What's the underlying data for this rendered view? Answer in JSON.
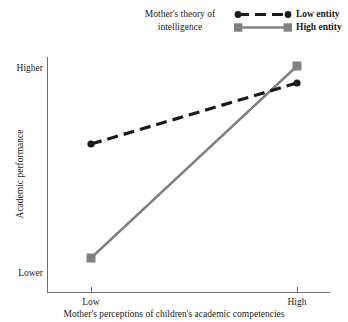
{
  "chart_data": {
    "type": "line",
    "title": "",
    "xlabel": "Mother's perceptions of children's academic competencies",
    "ylabel": "Academic performance",
    "categories": [
      "Low",
      "High"
    ],
    "x": [
      91,
      297
    ],
    "ytick_labels": [
      "Higher",
      "Lower"
    ],
    "ylim": [
      0,
      1
    ],
    "grid": false,
    "legend_position": "top-right",
    "legend_title": "Mother's theory of intelligence",
    "series": [
      {
        "name": "Low entity",
        "values": [
          0.63,
          0.89
        ],
        "px": [
          [
            91,
            144
          ],
          [
            297,
            83
          ]
        ],
        "color": "#1a1a1a",
        "linestyle": "dashed",
        "marker": "circle"
      },
      {
        "name": "High entity",
        "values": [
          0.15,
          0.96
        ],
        "px": [
          [
            91,
            258
          ],
          [
            297,
            66
          ]
        ],
        "color": "#808080",
        "linestyle": "solid",
        "marker": "square"
      }
    ]
  },
  "axes": {
    "y": {
      "title": "Academic performance",
      "high_label": "Higher",
      "low_label": "Lower"
    },
    "x": {
      "title": "Mother's perceptions of children's academic competencies",
      "tick_low": "Low",
      "tick_high": "High"
    }
  },
  "legend": {
    "title_line1": "Mother's theory of",
    "title_line2": "intelligence",
    "items": [
      {
        "label": "Low entity"
      },
      {
        "label": "High entity"
      }
    ]
  },
  "colors": {
    "low_entity": "#1a1a1a",
    "high_entity": "#808080",
    "axis": "#6e6e6e",
    "text": "#1a1a1a",
    "background": "#ffffff"
  }
}
